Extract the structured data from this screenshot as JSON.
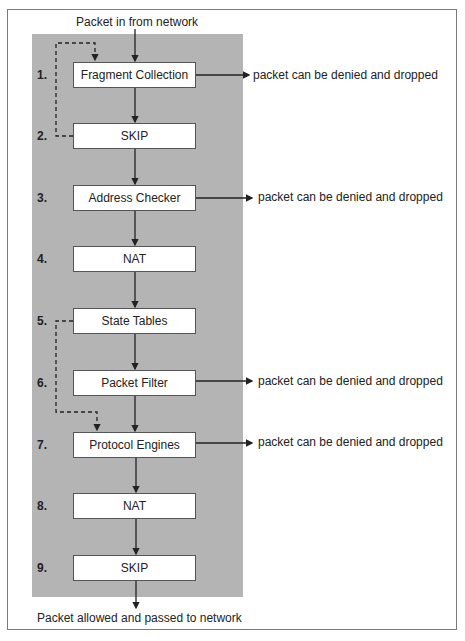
{
  "diagram": {
    "top_label": "Packet in from network",
    "bottom_label": "Packet allowed and passed to network",
    "drop_label": "packet can be denied and dropped",
    "steps": [
      {
        "num": "1.",
        "name": "Fragment Collection",
        "top": 62,
        "drop": true
      },
      {
        "num": "2.",
        "name": "SKIP",
        "top": 123,
        "drop": false
      },
      {
        "num": "3.",
        "name": "Address Checker",
        "top": 185,
        "drop": true
      },
      {
        "num": "4.",
        "name": "NAT",
        "top": 246,
        "drop": false
      },
      {
        "num": "5.",
        "name": "State Tables",
        "top": 308,
        "drop": false
      },
      {
        "num": "6.",
        "name": "Packet Filter",
        "top": 370,
        "drop": true
      },
      {
        "num": "7.",
        "name": "Protocol Engines",
        "top": 432,
        "drop": true
      },
      {
        "num": "8.",
        "name": "NAT",
        "top": 493,
        "drop": false
      },
      {
        "num": "9.",
        "name": "SKIP",
        "top": 555,
        "drop": false
      }
    ],
    "colors": {
      "panel": "#b4b4b4",
      "box": "#ffffff",
      "line": "#222222"
    }
  }
}
